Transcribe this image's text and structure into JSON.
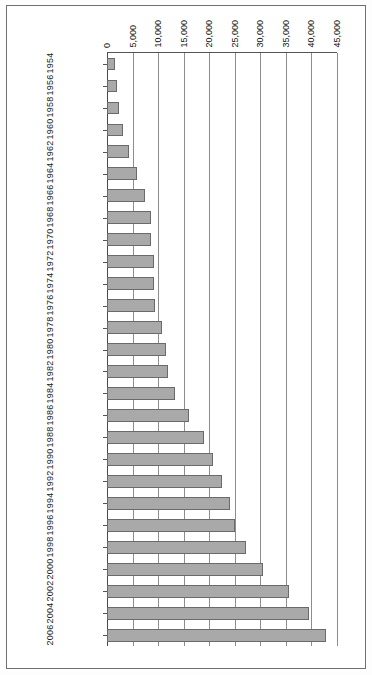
{
  "figure": {
    "orientation": "rotated-90",
    "background": "#ffffff",
    "bar_fill": "#a9a9a9",
    "bar_stroke": "#6a6a6a",
    "grid_color": "#8d8d8d",
    "axis_color": "#4a4a4a"
  },
  "chart_data": {
    "type": "bar",
    "title": "",
    "subtitle": "",
    "xlabel": "",
    "ylabel": "",
    "orientation": "horizontal",
    "grid": true,
    "legend": false,
    "legend_position": "none",
    "value_axis": {
      "min": 0,
      "max": 45000,
      "step": 5000,
      "tick_labels": [
        "45,000",
        "40,000",
        "35,000",
        "30,000",
        "25,000",
        "20,000",
        "15,000",
        "10,000",
        "5,000",
        "0"
      ],
      "tick_values": [
        45000,
        40000,
        35000,
        30000,
        25000,
        20000,
        15000,
        10000,
        5000,
        0
      ],
      "direction": "right-to-left"
    },
    "categories": [
      "1954",
      "1956",
      "1958",
      "1960",
      "1962",
      "1964",
      "1966",
      "1968",
      "1970",
      "1972",
      "1974",
      "1976",
      "1978",
      "1980",
      "1982",
      "1984",
      "1986",
      "1988",
      "1990",
      "1992",
      "1994",
      "1996",
      "1998",
      "2000",
      "2002",
      "2004",
      "2006"
    ],
    "values": [
      1600,
      2050,
      2400,
      3200,
      4300,
      5850,
      7500,
      8650,
      8650,
      9150,
      9150,
      9450,
      10800,
      11600,
      11900,
      13400,
      16100,
      19000,
      20700,
      22500,
      24000,
      25000,
      27200,
      30500,
      35700,
      39600,
      42800
    ],
    "ylim": [
      0,
      45000
    ]
  }
}
